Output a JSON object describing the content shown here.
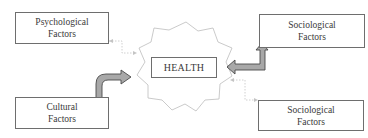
{
  "diagram": {
    "center": {
      "label": "HEALTH",
      "shape": "starburst"
    },
    "nodes": [
      {
        "id": "psych",
        "line1": "Psychological",
        "line2": "Factors",
        "position": "top-left",
        "connector": "dotted-arrow"
      },
      {
        "id": "socio_top",
        "line1": "Sociological",
        "line2": "Factors",
        "position": "top-right",
        "connector": "bent-block-arrow"
      },
      {
        "id": "cultural",
        "line1": "Cultural",
        "line2": "Factors",
        "position": "bottom-left",
        "connector": "curved-block-arrow"
      },
      {
        "id": "socio_bottom",
        "line1": "Sociological",
        "line2": "Factors",
        "position": "bottom-right",
        "connector": "dotted-arrow"
      }
    ],
    "colors": {
      "box_border": "#6e6e6e",
      "starburst_stroke": "#bdbdbd",
      "block_arrow_fill": "#a8a8a8",
      "block_arrow_stroke": "#4a4a4a",
      "dotted_line": "#c4c4c4"
    }
  }
}
